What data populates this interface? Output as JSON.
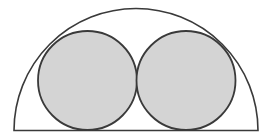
{
  "diagram": {
    "colors": {
      "stroke": "#3a3a3a",
      "circle_fill": "#d4d4d4",
      "background": "#ffffff"
    },
    "semicircle": {
      "cx": 136,
      "cy": 130.5,
      "r": 122
    },
    "circles": [
      {
        "name": "left-circle",
        "cx": 87.5,
        "cy": 80.5,
        "r": 49.5
      },
      {
        "name": "right-circle",
        "cx": 186,
        "cy": 80.5,
        "r": 49.5
      }
    ]
  }
}
